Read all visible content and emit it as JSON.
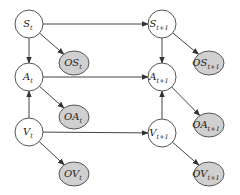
{
  "diagram": {
    "type": "dynamic-bayesian-network",
    "colors": {
      "hidden_fill": "#ffffff",
      "observed_fill": "#d0d0d0",
      "stroke": "#555555",
      "edge": "#444444"
    },
    "nodes": [
      {
        "id": "S_t",
        "base": "S",
        "sub": "t",
        "x": 29,
        "y": 24,
        "observed": false
      },
      {
        "id": "OS_t",
        "base": "OS",
        "sub": "t",
        "x": 74,
        "y": 63,
        "observed": true
      },
      {
        "id": "A_t",
        "base": "A",
        "sub": "t",
        "x": 29,
        "y": 77,
        "observed": false
      },
      {
        "id": "OA_t",
        "base": "OA",
        "sub": "t",
        "x": 74,
        "y": 117,
        "observed": true
      },
      {
        "id": "V_t",
        "base": "V",
        "sub": "t",
        "x": 29,
        "y": 132,
        "observed": false
      },
      {
        "id": "OV_t",
        "base": "OV",
        "sub": "t",
        "x": 74,
        "y": 174,
        "observed": true
      },
      {
        "id": "S_t1",
        "base": "S",
        "sub": "t+1",
        "x": 162,
        "y": 24,
        "observed": false
      },
      {
        "id": "OS_t1",
        "base": "OS",
        "sub": "t+1",
        "x": 209,
        "y": 63,
        "observed": true
      },
      {
        "id": "A_t1",
        "base": "A",
        "sub": "t+1",
        "x": 162,
        "y": 77,
        "observed": false
      },
      {
        "id": "OA_t1",
        "base": "OA",
        "sub": "t+1",
        "x": 209,
        "y": 125,
        "observed": true
      },
      {
        "id": "V_t1",
        "base": "V",
        "sub": "t+1",
        "x": 162,
        "y": 133,
        "observed": false
      },
      {
        "id": "OV_t1",
        "base": "OV",
        "sub": "t+1",
        "x": 209,
        "y": 174,
        "observed": true
      }
    ],
    "edges": [
      {
        "from": "S_t",
        "to": "A_t"
      },
      {
        "from": "S_t",
        "to": "OS_t"
      },
      {
        "from": "S_t",
        "to": "S_t1"
      },
      {
        "from": "A_t",
        "to": "A_t1"
      },
      {
        "from": "A_t",
        "to": "OA_t"
      },
      {
        "from": "V_t",
        "to": "A_t"
      },
      {
        "from": "V_t",
        "to": "OV_t"
      },
      {
        "from": "V_t",
        "to": "V_t1"
      },
      {
        "from": "S_t1",
        "to": "A_t1"
      },
      {
        "from": "S_t1",
        "to": "OS_t1"
      },
      {
        "from": "A_t1",
        "to": "OA_t1"
      },
      {
        "from": "V_t1",
        "to": "A_t1"
      },
      {
        "from": "V_t1",
        "to": "OV_t1"
      }
    ]
  }
}
